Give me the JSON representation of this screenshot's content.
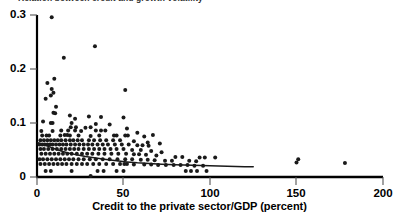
{
  "chart_data": {
    "type": "scatter",
    "title": "Relation between credit and growth volatility",
    "xlabel": "Credit to the private sector/GDP (percent)",
    "ylabel": "",
    "xlim": [
      0,
      200
    ],
    "ylim": [
      0,
      0.3
    ],
    "xticks": [
      0,
      50,
      100,
      150,
      200
    ],
    "xtick_labels": [
      "0",
      "50",
      "100",
      "150",
      "200"
    ],
    "yticks": [
      0,
      0.1,
      0.2,
      0.3
    ],
    "ytick_labels": [
      "0",
      "0.1",
      "0.2",
      "0.3"
    ],
    "grid": false,
    "legend": false,
    "marker_color": "#1a1a1a",
    "marker_size": 2.0,
    "axis_color": "#000000",
    "fit_line_color": "#1a1a1a",
    "series": [
      {
        "name": "Countries",
        "points": [
          [
            8.5,
            0.296
          ],
          [
            33.5,
            0.242
          ],
          [
            15.5,
            0.221
          ],
          [
            10.0,
            0.182
          ],
          [
            51.0,
            0.161
          ],
          [
            8.5,
            0.163
          ],
          [
            9.5,
            0.156
          ],
          [
            6.0,
            0.174
          ],
          [
            8.0,
            0.151
          ],
          [
            5.0,
            0.145
          ],
          [
            11.0,
            0.13
          ],
          [
            9.5,
            0.119
          ],
          [
            10.5,
            0.118
          ],
          [
            19.0,
            0.114
          ],
          [
            30.0,
            0.112
          ],
          [
            37.0,
            0.111
          ],
          [
            50.0,
            0.11
          ],
          [
            22.0,
            0.108
          ],
          [
            3.5,
            0.103
          ],
          [
            8.0,
            0.1
          ],
          [
            9.0,
            0.1
          ],
          [
            20.0,
            0.1
          ],
          [
            34.0,
            0.098
          ],
          [
            42.0,
            0.097
          ],
          [
            19.5,
            0.092
          ],
          [
            22.5,
            0.092
          ],
          [
            28.0,
            0.091
          ],
          [
            31.0,
            0.092
          ],
          [
            52.0,
            0.09
          ],
          [
            2.5,
            0.085
          ],
          [
            9.0,
            0.085
          ],
          [
            14.0,
            0.086
          ],
          [
            18.0,
            0.086
          ],
          [
            22.0,
            0.086
          ],
          [
            25.5,
            0.085
          ],
          [
            34.0,
            0.086
          ],
          [
            37.0,
            0.086
          ],
          [
            39.5,
            0.086
          ],
          [
            58.0,
            0.082
          ],
          [
            67.0,
            0.078
          ],
          [
            3.0,
            0.077
          ],
          [
            5.5,
            0.077
          ],
          [
            7.0,
            0.077
          ],
          [
            13.5,
            0.077
          ],
          [
            16.0,
            0.078
          ],
          [
            17.5,
            0.078
          ],
          [
            19.0,
            0.077
          ],
          [
            24.0,
            0.077
          ],
          [
            31.0,
            0.076
          ],
          [
            36.0,
            0.077
          ],
          [
            44.5,
            0.077
          ],
          [
            46.0,
            0.077
          ],
          [
            51.0,
            0.077
          ],
          [
            52.5,
            0.077
          ],
          [
            62.0,
            0.075
          ],
          [
            2.0,
            0.068
          ],
          [
            4.0,
            0.068
          ],
          [
            6.0,
            0.068
          ],
          [
            8.0,
            0.068
          ],
          [
            10.0,
            0.068
          ],
          [
            12.0,
            0.068
          ],
          [
            14.0,
            0.068
          ],
          [
            16.5,
            0.068
          ],
          [
            19.0,
            0.068
          ],
          [
            21.0,
            0.068
          ],
          [
            23.5,
            0.068
          ],
          [
            26.0,
            0.068
          ],
          [
            30.0,
            0.068
          ],
          [
            33.0,
            0.068
          ],
          [
            36.5,
            0.068
          ],
          [
            40.0,
            0.068
          ],
          [
            44.0,
            0.068
          ],
          [
            48.0,
            0.068
          ],
          [
            56.0,
            0.066
          ],
          [
            64.0,
            0.064
          ],
          [
            71.0,
            0.062
          ],
          [
            1.5,
            0.06
          ],
          [
            3.0,
            0.06
          ],
          [
            4.5,
            0.06
          ],
          [
            6.0,
            0.06
          ],
          [
            7.5,
            0.06
          ],
          [
            9.0,
            0.06
          ],
          [
            11.0,
            0.06
          ],
          [
            13.0,
            0.06
          ],
          [
            15.0,
            0.06
          ],
          [
            17.0,
            0.06
          ],
          [
            19.5,
            0.06
          ],
          [
            22.0,
            0.06
          ],
          [
            24.5,
            0.06
          ],
          [
            27.0,
            0.06
          ],
          [
            29.5,
            0.06
          ],
          [
            32.0,
            0.06
          ],
          [
            35.0,
            0.06
          ],
          [
            38.0,
            0.06
          ],
          [
            41.0,
            0.06
          ],
          [
            45.0,
            0.06
          ],
          [
            49.0,
            0.06
          ],
          [
            53.0,
            0.06
          ],
          [
            58.0,
            0.059
          ],
          [
            61.0,
            0.059
          ],
          [
            64.5,
            0.058
          ],
          [
            2.0,
            0.052
          ],
          [
            4.0,
            0.052
          ],
          [
            6.5,
            0.052
          ],
          [
            9.0,
            0.052
          ],
          [
            11.5,
            0.052
          ],
          [
            14.0,
            0.052
          ],
          [
            16.5,
            0.052
          ],
          [
            19.0,
            0.052
          ],
          [
            21.5,
            0.052
          ],
          [
            24.0,
            0.052
          ],
          [
            27.0,
            0.052
          ],
          [
            30.0,
            0.052
          ],
          [
            33.0,
            0.052
          ],
          [
            36.0,
            0.052
          ],
          [
            39.0,
            0.052
          ],
          [
            42.5,
            0.052
          ],
          [
            46.0,
            0.052
          ],
          [
            50.0,
            0.052
          ],
          [
            55.0,
            0.05
          ],
          [
            60.0,
            0.05
          ],
          [
            66.0,
            0.048
          ],
          [
            72.0,
            0.046
          ],
          [
            2.5,
            0.043
          ],
          [
            5.0,
            0.043
          ],
          [
            7.5,
            0.043
          ],
          [
            10.0,
            0.043
          ],
          [
            12.5,
            0.043
          ],
          [
            15.0,
            0.043
          ],
          [
            17.5,
            0.043
          ],
          [
            20.0,
            0.043
          ],
          [
            23.0,
            0.043
          ],
          [
            26.0,
            0.043
          ],
          [
            29.0,
            0.043
          ],
          [
            32.0,
            0.043
          ],
          [
            35.5,
            0.043
          ],
          [
            39.0,
            0.043
          ],
          [
            43.0,
            0.043
          ],
          [
            47.0,
            0.043
          ],
          [
            51.5,
            0.043
          ],
          [
            56.0,
            0.042
          ],
          [
            59.0,
            0.042
          ],
          [
            63.0,
            0.041
          ],
          [
            69.0,
            0.04
          ],
          [
            80.0,
            0.037
          ],
          [
            84.0,
            0.037
          ],
          [
            94.0,
            0.036
          ],
          [
            97.0,
            0.036
          ],
          [
            103.0,
            0.036
          ],
          [
            151.0,
            0.033
          ],
          [
            1.5,
            0.033
          ],
          [
            3.5,
            0.033
          ],
          [
            6.0,
            0.033
          ],
          [
            8.5,
            0.033
          ],
          [
            11.0,
            0.033
          ],
          [
            13.5,
            0.033
          ],
          [
            16.0,
            0.033
          ],
          [
            18.5,
            0.033
          ],
          [
            21.0,
            0.033
          ],
          [
            24.0,
            0.033
          ],
          [
            27.0,
            0.033
          ],
          [
            30.5,
            0.033
          ],
          [
            34.0,
            0.033
          ],
          [
            38.0,
            0.033
          ],
          [
            42.0,
            0.033
          ],
          [
            46.5,
            0.033
          ],
          [
            51.0,
            0.033
          ],
          [
            55.0,
            0.033
          ],
          [
            60.0,
            0.032
          ],
          [
            64.0,
            0.032
          ],
          [
            68.0,
            0.031
          ],
          [
            74.0,
            0.03
          ],
          [
            78.0,
            0.03
          ],
          [
            88.0,
            0.03
          ],
          [
            92.0,
            0.029
          ],
          [
            150.0,
            0.027
          ],
          [
            178.0,
            0.026
          ],
          [
            2.0,
            0.024
          ],
          [
            4.5,
            0.024
          ],
          [
            7.0,
            0.024
          ],
          [
            9.5,
            0.024
          ],
          [
            12.0,
            0.024
          ],
          [
            14.5,
            0.024
          ],
          [
            17.0,
            0.024
          ],
          [
            20.0,
            0.024
          ],
          [
            23.0,
            0.024
          ],
          [
            26.0,
            0.024
          ],
          [
            29.0,
            0.024
          ],
          [
            32.5,
            0.024
          ],
          [
            36.0,
            0.024
          ],
          [
            40.0,
            0.024
          ],
          [
            44.0,
            0.024
          ],
          [
            48.0,
            0.024
          ],
          [
            50.5,
            0.024
          ],
          [
            52.0,
            0.024
          ],
          [
            56.0,
            0.023
          ],
          [
            62.0,
            0.023
          ],
          [
            66.0,
            0.023
          ],
          [
            70.0,
            0.022
          ],
          [
            74.5,
            0.022
          ],
          [
            79.0,
            0.022
          ],
          [
            83.0,
            0.022
          ],
          [
            87.0,
            0.022
          ],
          [
            91.0,
            0.021
          ],
          [
            96.0,
            0.021
          ],
          [
            5.0,
            0.011
          ],
          [
            8.0,
            0.011
          ],
          [
            20.0,
            0.011
          ],
          [
            35.0,
            0.011
          ],
          [
            38.5,
            0.011
          ],
          [
            46.0,
            0.011
          ],
          [
            50.0,
            0.011
          ],
          [
            86.0,
            0.011
          ],
          [
            89.0,
            0.011
          ],
          [
            92.5,
            0.011
          ],
          [
            98.0,
            0.011
          ],
          [
            31.0,
            0.002
          ]
        ]
      }
    ],
    "fit_line": {
      "name": "fitted-trend",
      "points": [
        [
          0.5,
          0.0635
        ],
        [
          5.0,
          0.0585
        ],
        [
          10.0,
          0.0525
        ],
        [
          14.0,
          0.048
        ],
        [
          18.0,
          0.0445
        ],
        [
          23.0,
          0.041
        ],
        [
          28.0,
          0.038
        ],
        [
          34.0,
          0.035
        ],
        [
          40.0,
          0.0325
        ],
        [
          46.0,
          0.03
        ],
        [
          52.0,
          0.028
        ],
        [
          58.0,
          0.0262
        ],
        [
          65.0,
          0.0248
        ],
        [
          72.0,
          0.0238
        ],
        [
          80.0,
          0.0228
        ],
        [
          90.0,
          0.0218
        ],
        [
          100.0,
          0.0208
        ],
        [
          110.0,
          0.0198
        ],
        [
          120.0,
          0.0192
        ],
        [
          125.0,
          0.019
        ]
      ]
    }
  }
}
